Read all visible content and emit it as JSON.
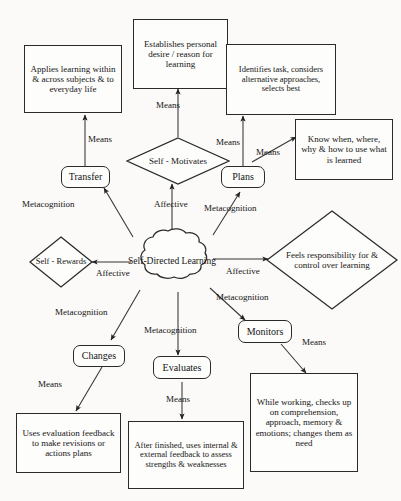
{
  "diagram": {
    "stroke_color": "#2a2a2a",
    "background_color": "#fbfaf8",
    "nodes": {
      "applies_learning": "Applies learning within & across subjects & to everyday life",
      "establishes_desire": "Establishes personal desire / reason for learning",
      "identifies_task": "Identifies task, considers alternative approaches, selects best",
      "know_when": "Know when, where, why & how to use what is learned",
      "self_motivates": "Self - Motivates",
      "transfer": "Transfer",
      "plans": "Plans",
      "self_rewards": "Self - Rewards",
      "self_directed_learning": "Self-Directed Learning",
      "feels_responsibility": "Feels responsibility for & control over learning",
      "changes": "Changes",
      "evaluates": "Evaluates",
      "monitors": "Monitors",
      "uses_evaluation_feedback": "Uses evaluation feedback to make revisions or actions plans",
      "after_finished": "After finished, uses internal & external feedback to assess strengths & weaknesses",
      "while_working": "While working, checks up on comprehension, approach, memory & emotions; changes them as need"
    },
    "edge_labels": {
      "means_transfer_to_applies": "Means",
      "means_motivates_to_establishes": "Means",
      "means_plans_to_identifies": "Means",
      "means_plans_to_know_when": "Means",
      "metacognition_to_transfer": "Metacognition",
      "affective_to_motivates": "Affective",
      "metacognition_to_plans": "Metacognition",
      "affective_to_rewards": "Affective",
      "affective_to_feels": "Affective",
      "metacognition_to_changes": "Metacognition",
      "metacognition_to_evaluates": "Metacognition",
      "metacognition_to_monitors": "Metacognition",
      "means_changes_to_uses": "Means",
      "means_evaluates_to_after": "Means",
      "means_monitors_to_while": "Means"
    }
  }
}
